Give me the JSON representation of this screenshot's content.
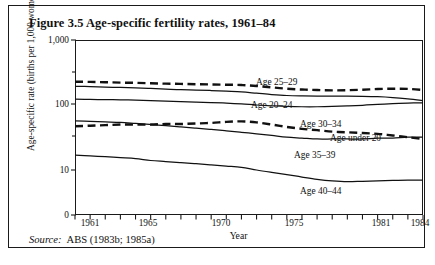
{
  "figure": {
    "title": "Figure 3.5  Age-specific fertility rates, 1961–84",
    "source_label": "Source:",
    "source_text": "ABS (1983b; 1985a)"
  },
  "chart_data": {
    "type": "line",
    "title": "Figure 3.5  Age-specific fertility rates, 1961–84",
    "xlabel": "Year",
    "ylabel": "Age-specific rate (births per 1,000 women)",
    "yscale": "log",
    "ylim": [
      1,
      1000
    ],
    "ytick_labels": [
      "1,000",
      "100",
      "10",
      "0"
    ],
    "ytick_values": [
      1000,
      100,
      10,
      0
    ],
    "xlim": [
      1961,
      1984
    ],
    "xtick_labels": [
      "1961",
      "1965",
      "1970",
      "1975",
      "1981",
      "1984"
    ],
    "xtick_values": [
      1961,
      1965,
      1970,
      1975,
      1981,
      1984
    ],
    "minor_xticks": "annual",
    "grid": false,
    "legend": "inline annotations",
    "x": [
      1961,
      1962,
      1963,
      1964,
      1965,
      1966,
      1967,
      1968,
      1969,
      1970,
      1971,
      1972,
      1973,
      1974,
      1975,
      1976,
      1977,
      1978,
      1979,
      1980,
      1981,
      1982,
      1983,
      1984
    ],
    "series": [
      {
        "name": "Age 25–29",
        "style": "dashed",
        "values": [
          228,
          227,
          224,
          221,
          219,
          216,
          213,
          211,
          209,
          207,
          205,
          203,
          196,
          187,
          178,
          173,
          170,
          168,
          169,
          172,
          176,
          178,
          177,
          170
        ]
      },
      {
        "name": "Age 20–24",
        "style": "solid",
        "values": [
          194,
          192,
          189,
          186,
          183,
          180,
          176,
          172,
          170,
          167,
          163,
          159,
          152,
          145,
          140,
          138,
          137,
          137,
          137,
          136,
          134,
          130,
          124,
          117
        ]
      },
      {
        "name": "Age 30–34",
        "style": "solid",
        "values": [
          123,
          122,
          121,
          120,
          119,
          117,
          115,
          113,
          111,
          109,
          107,
          104,
          100,
          97,
          95,
          94,
          94,
          95,
          97,
          99,
          102,
          105,
          107,
          108
        ]
      },
      {
        "name": "Age under 20",
        "style": "dashed",
        "values": [
          47,
          48,
          49,
          50,
          50,
          50,
          51,
          51,
          52,
          53,
          55,
          56,
          54,
          50,
          46,
          43,
          41,
          39,
          38,
          37,
          36,
          34,
          32,
          30
        ]
      },
      {
        "name": "Age 35–39",
        "style": "solid",
        "values": [
          57,
          56,
          55,
          54,
          52,
          50,
          48,
          46,
          44,
          42,
          40,
          38,
          36,
          34,
          32,
          31,
          30,
          30,
          30,
          30,
          31,
          31,
          32,
          32
        ]
      },
      {
        "name": "Age 40–44",
        "style": "solid",
        "values": [
          17,
          16.5,
          16,
          15.5,
          15,
          14,
          13.5,
          13,
          12.5,
          12,
          11.5,
          11,
          10,
          9.2,
          8.5,
          7.8,
          7.2,
          6.8,
          6.6,
          6.7,
          6.8,
          6.9,
          7.0,
          7.0
        ]
      }
    ],
    "annotations": [
      {
        "text": "Age 25–29",
        "x": 1971.2,
        "y": 250
      },
      {
        "text": "Age 20–24",
        "x": 1970.6,
        "y": 138
      },
      {
        "text": "Age 30–34",
        "x": 1974.6,
        "y": 78
      },
      {
        "text": "Age under 20",
        "x": 1978.6,
        "y": 57
      },
      {
        "text": "Age 35–39",
        "x": 1973.2,
        "y": 25
      },
      {
        "text": "Age 40–44",
        "x": 1974.2,
        "y": 10
      }
    ]
  },
  "yticks": [
    {
      "label": "1,000",
      "top": 0
    },
    {
      "label": "100",
      "top": 64
    },
    {
      "label": "10",
      "top": 130
    },
    {
      "label": "0",
      "top": 175
    }
  ],
  "xticks": [
    {
      "label": "1961",
      "left": 81
    },
    {
      "label": "1965",
      "left": 139
    },
    {
      "label": "1970",
      "left": 212
    },
    {
      "label": "1975",
      "left": 285
    },
    {
      "label": "1981",
      "left": 372
    },
    {
      "label": "1984",
      "left": 411
    }
  ],
  "axis_titles": {
    "y": "Age-specific rate (births per 1,000 women)",
    "x": "Year"
  },
  "series_labels": [
    {
      "text": "Age 25–29",
      "left": 247,
      "top": 71
    },
    {
      "text": "Age 20–24",
      "left": 242,
      "top": 94
    },
    {
      "text": "Age 30–34",
      "left": 291,
      "top": 113
    },
    {
      "text": "Age under 20",
      "left": 321,
      "top": 127
    },
    {
      "text": "Age 35–39",
      "left": 285,
      "top": 144
    },
    {
      "text": "Age 40–44",
      "left": 291,
      "top": 180
    }
  ]
}
